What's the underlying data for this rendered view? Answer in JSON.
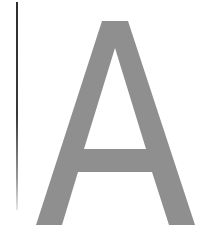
{
  "glyph": {
    "character": "A",
    "fill_color": "#8f8f8f"
  },
  "rule": {
    "color_top": "#2e2e2e",
    "color_bottom": "#e6e6e6"
  },
  "background_color": "#ffffff"
}
